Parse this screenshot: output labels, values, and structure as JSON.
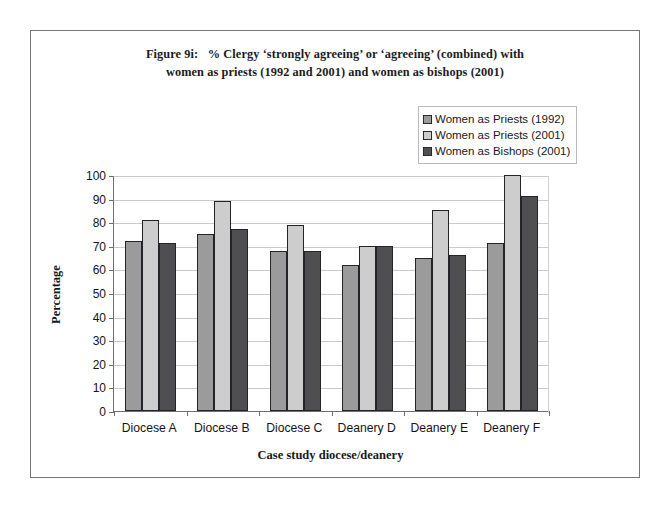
{
  "figure": {
    "title_line1": "Figure 9i:   % Clergy ‘strongly agreeing’ or ‘agreeing’ (combined) with",
    "title_line2": "women as priests (1992 and 2001) and women as bishops (2001)"
  },
  "colors": {
    "series_1": "#9b9b9b",
    "series_2": "#cdcdcd",
    "series_3": "#4f4f52",
    "gridline": "#c9cacf",
    "axis": "#6e6f75",
    "frame": "#75767c",
    "bar_outline": "#242428"
  },
  "chart_data": {
    "type": "bar",
    "title": "Figure 9i:   % Clergy ‘strongly agreeing’ or ‘agreeing’ (combined) with women as priests (1992 and 2001) and women as bishops (2001)",
    "xlabel": "Case study diocese/deanery",
    "ylabel": "Percentage",
    "ylim": [
      0,
      100
    ],
    "ytick_step": 10,
    "yticks": [
      0,
      10,
      20,
      30,
      40,
      50,
      60,
      70,
      80,
      90,
      100
    ],
    "ytick_labels": [
      "0",
      "10",
      "20",
      "30",
      "40",
      "50",
      "60",
      "70",
      "80",
      "90",
      "100"
    ],
    "grid": true,
    "grid_axis": "y",
    "legend_position": "upper right (inside, above plot)",
    "categories": [
      "Diocese A",
      "Diocese B",
      "Diocese C",
      "Deanery D",
      "Deanery E",
      "Deanery F"
    ],
    "series": [
      {
        "name": "Women as Priests (1992)",
        "color": "#9b9b9b",
        "values": [
          72,
          75,
          68,
          62,
          65,
          71
        ]
      },
      {
        "name": "Women as Priests (2001)",
        "color": "#cdcdcd",
        "values": [
          81,
          89,
          79,
          70,
          85,
          100
        ]
      },
      {
        "name": "Women as Bishops (2001)",
        "color": "#4f4f52",
        "values": [
          71,
          77,
          68,
          70,
          66,
          91
        ]
      }
    ]
  }
}
